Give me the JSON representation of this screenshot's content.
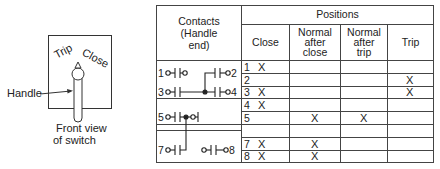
{
  "switch_view": {
    "trip_label": "Trip",
    "close_label": "Close",
    "handle_label": "Handle",
    "caption_line1": "Front view",
    "caption_line2": "of switch"
  },
  "table": {
    "contacts_header_line1": "Contacts",
    "contacts_header_line2": "(Handle",
    "contacts_header_line3": "end)",
    "positions_header": "Positions",
    "columns": [
      {
        "lines": [
          "Close"
        ]
      },
      {
        "lines": [
          "Normal",
          "after",
          "close"
        ]
      },
      {
        "lines": [
          "Normal",
          "after",
          "trip"
        ]
      },
      {
        "lines": [
          "Trip"
        ]
      }
    ],
    "contact_terminals": [
      "1",
      "2",
      "3",
      "4",
      "5",
      "7",
      "8"
    ],
    "rows": [
      {
        "num": "1",
        "close": "X",
        "normal_after_close": "",
        "normal_after_trip": "",
        "trip": ""
      },
      {
        "num": "2",
        "close": "",
        "normal_after_close": "",
        "normal_after_trip": "",
        "trip": "X"
      },
      {
        "num": "3",
        "close": "X",
        "normal_after_close": "",
        "normal_after_trip": "",
        "trip": "X"
      },
      {
        "num": "4",
        "close": "X",
        "normal_after_close": "",
        "normal_after_trip": "",
        "trip": ""
      },
      {
        "num": "5",
        "close": "",
        "normal_after_close": "X",
        "normal_after_trip": "X",
        "trip": ""
      },
      {
        "num": "",
        "close": "",
        "normal_after_close": "",
        "normal_after_trip": "",
        "trip": ""
      },
      {
        "num": "7",
        "close": "X",
        "normal_after_close": "X",
        "normal_after_trip": "",
        "trip": ""
      },
      {
        "num": "8",
        "close": "X",
        "normal_after_close": "X",
        "normal_after_trip": "",
        "trip": ""
      }
    ]
  }
}
